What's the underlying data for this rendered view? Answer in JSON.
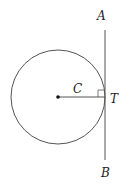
{
  "diagram": {
    "labels": {
      "A": "A",
      "B": "B",
      "C": "C",
      "T": "T"
    },
    "colors": {
      "stroke": "#555555",
      "text": "#222222",
      "background": "#ffffff"
    }
  }
}
